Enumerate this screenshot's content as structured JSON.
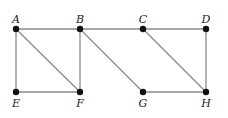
{
  "graph": {
    "nodes": [
      {
        "id": "A",
        "label": "A",
        "x": 16,
        "y": 29,
        "label_pos": "above"
      },
      {
        "id": "B",
        "label": "B",
        "x": 80,
        "y": 29,
        "label_pos": "above"
      },
      {
        "id": "C",
        "label": "C",
        "x": 143,
        "y": 29,
        "label_pos": "above"
      },
      {
        "id": "D",
        "label": "D",
        "x": 206,
        "y": 29,
        "label_pos": "above"
      },
      {
        "id": "E",
        "label": "E",
        "x": 16,
        "y": 92,
        "label_pos": "below"
      },
      {
        "id": "F",
        "label": "F",
        "x": 80,
        "y": 92,
        "label_pos": "below"
      },
      {
        "id": "G",
        "label": "G",
        "x": 143,
        "y": 92,
        "label_pos": "below"
      },
      {
        "id": "H",
        "label": "H",
        "x": 206,
        "y": 92,
        "label_pos": "below"
      }
    ],
    "edges": [
      [
        "A",
        "B"
      ],
      [
        "B",
        "C"
      ],
      [
        "C",
        "D"
      ],
      [
        "A",
        "E"
      ],
      [
        "A",
        "F"
      ],
      [
        "B",
        "F"
      ],
      [
        "B",
        "G"
      ],
      [
        "C",
        "H"
      ],
      [
        "D",
        "H"
      ],
      [
        "E",
        "F"
      ],
      [
        "G",
        "H"
      ]
    ],
    "colors": {
      "edge": "#8a8a8a",
      "node": "#111111",
      "label": "#222222"
    }
  }
}
